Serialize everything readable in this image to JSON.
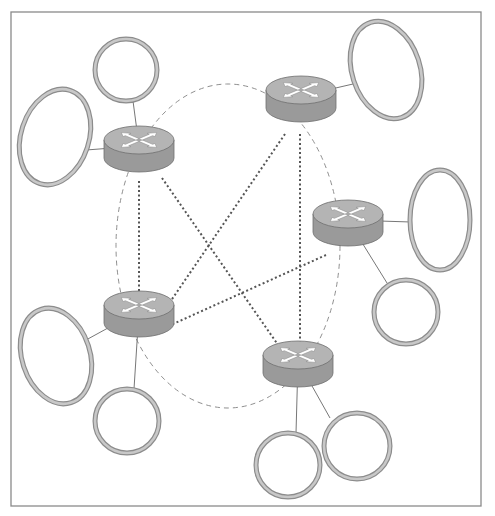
{
  "diagram": {
    "type": "network-topology",
    "frame": {
      "x": 11,
      "y": 12,
      "w": 470,
      "h": 494,
      "stroke": "#8a8a8a"
    },
    "colors": {
      "router_top": "#b4b4b4",
      "router_side": "#9a9a9a",
      "router_stroke": "#6e6e6e",
      "arrow_fill": "#ffffff",
      "ring_stroke": "#8c8c8c",
      "ring_fill": "#c8c8c8",
      "link": "#777777",
      "dotted_link": "#555555",
      "dashed_ring": "#8f8f8f"
    },
    "backbone_ellipse": {
      "cx": 228,
      "cy": 246,
      "rx": 112,
      "ry": 162
    },
    "routers": [
      {
        "id": "r1",
        "cx": 139,
        "cy": 148
      },
      {
        "id": "r2",
        "cx": 301,
        "cy": 98
      },
      {
        "id": "r3",
        "cx": 348,
        "cy": 222
      },
      {
        "id": "r4",
        "cx": 139,
        "cy": 313
      },
      {
        "id": "r5",
        "cx": 298,
        "cy": 363
      }
    ],
    "networks": [
      {
        "id": "n1",
        "cx": 126,
        "cy": 70,
        "rx": 31,
        "ry": 31,
        "rot": 0,
        "router": "r1",
        "ax": 133,
        "ay": 101
      },
      {
        "id": "n2",
        "cx": 55,
        "cy": 137,
        "rx": 34,
        "ry": 49,
        "rot": 18,
        "router": "r1",
        "ax": 86,
        "ay": 150
      },
      {
        "id": "n3",
        "cx": 386,
        "cy": 70,
        "rx": 34,
        "ry": 50,
        "rot": -18,
        "router": "r2",
        "ax": 353,
        "ay": 84
      },
      {
        "id": "n4",
        "cx": 440,
        "cy": 220,
        "rx": 30,
        "ry": 50,
        "rot": 0,
        "router": "r3",
        "ax": 411,
        "ay": 222
      },
      {
        "id": "n5",
        "cx": 406,
        "cy": 312,
        "rx": 32,
        "ry": 32,
        "rot": 0,
        "router": "r3",
        "ax": 387,
        "ay": 283
      },
      {
        "id": "n6",
        "cx": 56,
        "cy": 356,
        "rx": 34,
        "ry": 49,
        "rot": -18,
        "router": "r4",
        "ax": 86,
        "ay": 340
      },
      {
        "id": "n7",
        "cx": 127,
        "cy": 421,
        "rx": 32,
        "ry": 32,
        "rot": 0,
        "router": "r4",
        "ax": 134,
        "ay": 389
      },
      {
        "id": "n8",
        "cx": 357,
        "cy": 446,
        "rx": 33,
        "ry": 33,
        "rot": 0,
        "router": "r5",
        "ax": 330,
        "ay": 418
      },
      {
        "id": "n9",
        "cx": 288,
        "cy": 465,
        "rx": 32,
        "ry": 32,
        "rot": 0,
        "router": "r5",
        "ax": 296,
        "ay": 433
      }
    ],
    "dotted_links": [
      {
        "from": "r1",
        "to": "r4",
        "x1": 139,
        "y1": 181,
        "x2": 139,
        "y2": 302
      },
      {
        "from": "r1",
        "to": "r5",
        "x1": 162,
        "y1": 178,
        "x2": 283,
        "y2": 352
      },
      {
        "from": "r2",
        "to": "r4",
        "x1": 285,
        "y1": 134,
        "x2": 168,
        "y2": 305
      },
      {
        "from": "r2",
        "to": "r5",
        "x1": 300,
        "y1": 134,
        "x2": 300,
        "y2": 352
      },
      {
        "from": "r3",
        "to": "r4",
        "x1": 326,
        "y1": 255,
        "x2": 173,
        "y2": 324
      }
    ]
  }
}
